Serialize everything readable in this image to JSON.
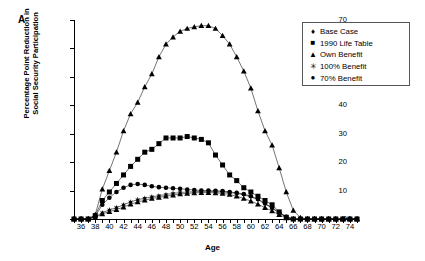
{
  "panel": {
    "label": "A"
  },
  "axes": {
    "xlabel": "Age",
    "ylabel_line1": "Percentage Point Reduction in",
    "ylabel_line2": "Social Security Participation",
    "xticks": [
      36,
      38,
      40,
      42,
      44,
      46,
      48,
      50,
      52,
      54,
      56,
      58,
      60,
      62,
      64,
      66,
      68,
      70,
      72,
      74
    ],
    "yticks": [
      0,
      10,
      20,
      30,
      40,
      50,
      60,
      70
    ],
    "xlim": [
      35,
      75
    ],
    "ylim": [
      0,
      70
    ]
  },
  "legend": {
    "position": "top-right",
    "items": [
      {
        "label": "Base Case",
        "marker": "diamond-marker"
      },
      {
        "label": "1990 Life Table",
        "marker": "square-marker"
      },
      {
        "label": "Own Benefit",
        "marker": "triangle-marker"
      },
      {
        "label": "100% Benefit",
        "marker": "star-marker"
      },
      {
        "label": "70% Benefit",
        "marker": "circle-marker"
      }
    ]
  },
  "chart_data": {
    "type": "line",
    "title": "",
    "xlabel": "Age",
    "ylabel": "Percentage Point Reduction in Social Security Participation",
    "xlim": [
      35,
      75
    ],
    "ylim": [
      0,
      70
    ],
    "grid": false,
    "legend_position": "top-right",
    "x": [
      35,
      36,
      37,
      38,
      39,
      40,
      41,
      42,
      43,
      44,
      45,
      46,
      47,
      48,
      49,
      50,
      51,
      52,
      53,
      54,
      55,
      56,
      57,
      58,
      59,
      60,
      61,
      62,
      63,
      64,
      65,
      66,
      67,
      68,
      69,
      70,
      71,
      72,
      73,
      74,
      75
    ],
    "series": [
      {
        "name": "Base Case",
        "marker": "triangle-marker",
        "values": [
          0,
          0,
          0,
          1.5,
          10.5,
          17.0,
          23.5,
          31.0,
          37.0,
          41.0,
          46.5,
          51.0,
          57.0,
          61.5,
          64.0,
          66.0,
          67.0,
          67.6,
          68.0,
          68.0,
          67.0,
          64.5,
          61.5,
          57.0,
          52.0,
          46.0,
          38.0,
          31.0,
          26.0,
          18.0,
          9.5,
          3.0,
          0.5,
          0,
          0,
          0,
          0,
          0,
          0,
          0,
          0
        ]
      },
      {
        "name": "1990 Life Table",
        "marker": "square-marker",
        "values": [
          0,
          0,
          0,
          1.2,
          6.5,
          9.5,
          12.5,
          15.5,
          18.5,
          21.0,
          23.5,
          24.5,
          26.5,
          28.5,
          28.5,
          28.5,
          29.0,
          28.5,
          28.0,
          26.8,
          22.5,
          19.0,
          15.5,
          13.5,
          11.0,
          9.5,
          8.0,
          6.5,
          5.0,
          2.5,
          0.6,
          0,
          0,
          0,
          0,
          0,
          0,
          0,
          0,
          0,
          0
        ]
      },
      {
        "name": "70% Benefit",
        "marker": "circle-marker",
        "values": [
          0,
          0,
          0,
          1.0,
          5.0,
          7.5,
          9.5,
          11.0,
          12.0,
          12.3,
          12.0,
          11.5,
          11.2,
          11.0,
          10.8,
          10.6,
          10.4,
          10.2,
          10.0,
          10.0,
          9.9,
          9.8,
          9.5,
          9.2,
          8.8,
          8.0,
          7.0,
          5.5,
          4.0,
          2.3,
          0.8,
          0,
          0,
          0,
          0,
          0,
          0,
          0,
          0,
          0,
          0
        ]
      },
      {
        "name": "100% Benefit",
        "marker": "star-marker",
        "values": [
          0,
          0,
          0,
          0.8,
          2.2,
          3.2,
          4.0,
          5.0,
          6.0,
          6.8,
          7.3,
          7.8,
          8.2,
          8.6,
          9.0,
          9.3,
          9.5,
          9.6,
          9.7,
          9.7,
          9.6,
          9.5,
          9.3,
          9.0,
          8.5,
          7.8,
          6.8,
          5.3,
          3.8,
          2.1,
          0.7,
          0,
          0,
          0,
          0,
          0,
          0,
          0,
          0,
          0,
          0
        ]
      },
      {
        "name": "Own Benefit",
        "marker": "triangle-marker",
        "values": [
          0,
          0,
          0,
          0.6,
          1.8,
          2.6,
          3.3,
          4.2,
          5.2,
          6.0,
          6.6,
          7.2,
          7.6,
          8.0,
          8.4,
          8.8,
          9.0,
          9.2,
          9.3,
          9.3,
          9.2,
          9.0,
          8.6,
          8.0,
          7.2,
          6.3,
          5.2,
          4.0,
          2.8,
          1.5,
          0.4,
          0,
          0,
          0,
          0,
          0,
          0,
          0,
          0,
          0,
          0
        ]
      }
    ]
  }
}
